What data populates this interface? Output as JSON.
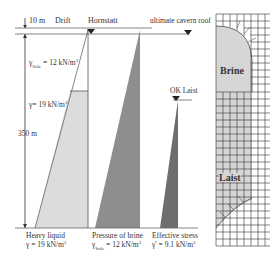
{
  "diagram": {
    "top_labels": {
      "depth_top": "10 m",
      "drift": "Drift",
      "hornstatt": "Hornstatt",
      "cavern_roof": "ultimate cavern roof",
      "ok_laist": "OK Laist"
    },
    "left_labels": {
      "gamma_brine": "γ",
      "gamma_brine_sub": "Sole",
      "gamma_brine_value": " = 12 kN/m",
      "gamma_heavy": "γ= 19 kN/m",
      "depth": "350 m",
      "exp": "3"
    },
    "bottom_labels": {
      "heavy_liquid_title": "Heavy liquid",
      "heavy_liquid_value": "γ = 19 kN/m",
      "brine_title": "Pressure of brine",
      "brine_gamma": "γ",
      "brine_sub": "Sole",
      "brine_value": " = 12 kN/m",
      "effective_title": "Effective stress",
      "effective_value": "γ' = 9.1 kN/m",
      "exp": "3"
    },
    "mesh_labels": {
      "brine": "Brine",
      "laist": "Laist"
    },
    "colors": {
      "light_fill": "#dcdcdc",
      "medium_fill": "#8e8e8e",
      "dark_fill": "#6e6e6e",
      "line": "#555555",
      "mesh_line": "#333333"
    }
  }
}
